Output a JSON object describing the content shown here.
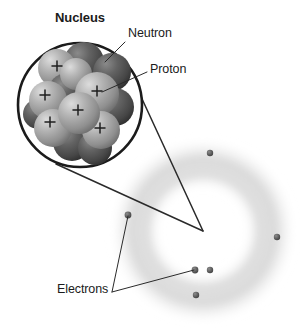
{
  "figure": {
    "background_color": "#ffffff"
  },
  "labels": {
    "nucleus": "Nucleus",
    "neutron": "Neutron",
    "proton": "Proton",
    "electrons": "Electrons",
    "proton_charge_symbol": "+"
  },
  "colors": {
    "outline": "#1b1b1b",
    "proton_sphere": "#a8a8a8",
    "proton_sphere_dark": "#7c7c7c",
    "neutron_sphere": "#5c5c5c",
    "neutron_sphere_dark": "#333333",
    "electron_dot": "#5a5a5a",
    "electron_cloud": "#b8b8b8",
    "leader_line": "#2a2a2a",
    "text": "#1b1b1b"
  },
  "nucleus": {
    "circle": {
      "cx": 80,
      "cy": 105,
      "r": 62,
      "stroke_width": 2.6
    },
    "protons": [
      {
        "cx": 57,
        "cy": 68,
        "r": 19,
        "plus_x": 57,
        "plus_y": 68
      },
      {
        "cx": 48,
        "cy": 100,
        "r": 19,
        "plus_x": 45,
        "plus_y": 94
      },
      {
        "cx": 97,
        "cy": 94,
        "r": 22,
        "plus_x": 97,
        "plus_y": 91
      },
      {
        "cx": 79,
        "cy": 113,
        "r": 21,
        "plus_x": 78,
        "plus_y": 110
      },
      {
        "cx": 53,
        "cy": 128,
        "r": 19,
        "plus_x": 50,
        "plus_y": 121
      },
      {
        "cx": 101,
        "cy": 130,
        "r": 19,
        "plus_x": 100,
        "plus_y": 127
      },
      {
        "cx": 76,
        "cy": 74,
        "r": 16,
        "plus_x": 76,
        "plus_y": 74
      }
    ],
    "neutrons": [
      {
        "cx": 84,
        "cy": 62,
        "r": 20
      },
      {
        "cx": 112,
        "cy": 72,
        "r": 19
      },
      {
        "cx": 67,
        "cy": 92,
        "r": 19
      },
      {
        "cx": 115,
        "cy": 107,
        "r": 19
      },
      {
        "cx": 72,
        "cy": 142,
        "r": 19
      },
      {
        "cx": 95,
        "cy": 148,
        "r": 17
      },
      {
        "cx": 38,
        "cy": 114,
        "r": 15
      }
    ],
    "proton_count": 7,
    "neutron_count": 7
  },
  "electron_cloud": {
    "center": {
      "cx": 203,
      "cy": 231
    },
    "rings": [
      {
        "r": 48,
        "thickness": 16,
        "opacity": 0.38
      },
      {
        "r": 76,
        "thickness": 20,
        "opacity": 0.32
      }
    ],
    "outer_radius": 92
  },
  "electrons": [
    {
      "id": "electron-top",
      "cx": 210,
      "cy": 153,
      "r": 3.2
    },
    {
      "id": "electron-right",
      "cx": 277,
      "cy": 237,
      "r": 3.2
    },
    {
      "id": "electron-left",
      "cx": 128,
      "cy": 215,
      "r": 3.4
    },
    {
      "id": "electron-lower-inner",
      "cx": 195,
      "cy": 270,
      "r": 3.4
    },
    {
      "id": "electron-lower-mid",
      "cx": 210,
      "cy": 270,
      "r": 3.2
    },
    {
      "id": "electron-bottom",
      "cx": 196,
      "cy": 295,
      "r": 3.2
    }
  ],
  "magnifier_cone": {
    "apex": {
      "x": 203,
      "y": 231
    },
    "from_circle_top": {
      "x": 125,
      "y": 62
    },
    "from_circle_bottom": {
      "x": 56,
      "y": 164
    }
  },
  "leader_lines": {
    "neutron": {
      "x1": 125,
      "y1": 42,
      "x2": 105,
      "y2": 62
    },
    "proton": {
      "x1": 147,
      "y1": 72,
      "x2": 102,
      "y2": 92
    },
    "electrons_to_left": {
      "x1": 112,
      "y1": 292,
      "x2": 128,
      "y2": 216
    },
    "electrons_to_lower": {
      "x1": 112,
      "y1": 292,
      "x2": 194,
      "y2": 270
    }
  }
}
